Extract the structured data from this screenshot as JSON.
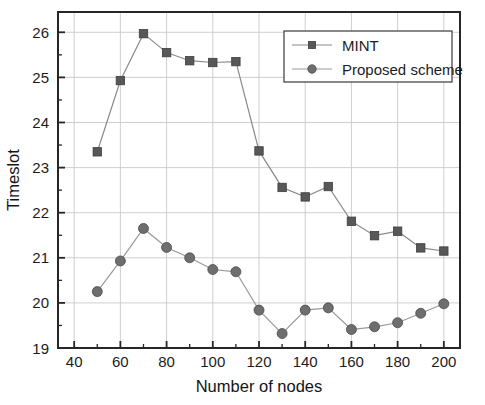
{
  "chart_data": {
    "type": "line",
    "title": "",
    "xlabel": "Number of nodes",
    "ylabel": "Timeslot",
    "xlim": [
      33,
      207
    ],
    "ylim": [
      19,
      26.45
    ],
    "xticks": [
      40,
      60,
      80,
      100,
      120,
      140,
      160,
      180,
      200
    ],
    "yticks": [
      19,
      20,
      21,
      22,
      23,
      24,
      25,
      26
    ],
    "x_minor_step": 10,
    "y_minor_step": 0.5,
    "grid": true,
    "legend_position": "top-right",
    "x": [
      50,
      60,
      70,
      80,
      90,
      100,
      110,
      120,
      130,
      140,
      150,
      160,
      170,
      180,
      190,
      200
    ],
    "series": [
      {
        "name": "MINT",
        "marker": "square",
        "color": "#585858",
        "line_color": "#8a8a8a",
        "values": [
          23.35,
          24.93,
          25.97,
          25.55,
          25.37,
          25.33,
          25.35,
          23.37,
          22.56,
          22.35,
          22.58,
          21.81,
          21.49,
          21.59,
          21.22,
          21.15
        ]
      },
      {
        "name": "Proposed scheme",
        "marker": "circle",
        "color": "#6e6e6e",
        "line_color": "#9a9a9a",
        "values": [
          20.25,
          20.93,
          21.65,
          21.23,
          21.0,
          20.74,
          20.69,
          19.84,
          19.32,
          19.84,
          19.89,
          19.41,
          19.47,
          19.56,
          19.77,
          19.98
        ]
      }
    ]
  },
  "axes": {
    "x_tick_labels": [
      "40",
      "60",
      "80",
      "100",
      "120",
      "140",
      "160",
      "180",
      "200"
    ],
    "y_tick_labels": [
      "19",
      "20",
      "21",
      "22",
      "23",
      "24",
      "25",
      "26"
    ],
    "x_axis_title": "Number of nodes",
    "y_axis_title": "Timeslot"
  },
  "legend": {
    "entries": [
      {
        "label": "MINT",
        "marker": "square-marker"
      },
      {
        "label": "Proposed scheme",
        "marker": "circle-marker"
      }
    ]
  },
  "colors": {
    "background": "#ffffff",
    "grid": "#c9c9c9",
    "frame": "#262626",
    "series_mint": "#585858",
    "series_proposed": "#6e6e6e",
    "text": "#1c1c1c"
  }
}
